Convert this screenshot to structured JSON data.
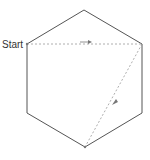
{
  "diagram": {
    "start_label": "Start",
    "shape": "hexagon",
    "path": [
      {
        "from": "upper-left vertex",
        "to": "upper-right vertex",
        "style": "dashed",
        "direction": "right-arrow"
      },
      {
        "from": "upper-right vertex",
        "to": "bottom vertex",
        "style": "dashed",
        "direction": "down-left-arrow"
      }
    ],
    "colors": {
      "outline": "#555555",
      "path": "#999999",
      "text": "#333333"
    }
  }
}
